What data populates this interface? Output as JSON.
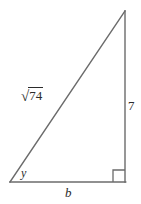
{
  "figure": {
    "shape": "right triangle",
    "stroke_color": "#6b6b6b",
    "label_color": "#2b2b2b",
    "background_color": "#ffffff",
    "stroke_width": 1.4,
    "vertices": {
      "left": [
        10,
        182
      ],
      "top_right": [
        125,
        11
      ],
      "bottom_right": [
        125,
        182
      ]
    },
    "right_angle_marker": {
      "at_vertex": "bottom_right",
      "size": 12
    },
    "labels": {
      "hypotenuse_radical_sign": "√",
      "hypotenuse_radicand": "74",
      "vertical_leg": "7",
      "base_leg": "b",
      "angle": "y"
    }
  }
}
